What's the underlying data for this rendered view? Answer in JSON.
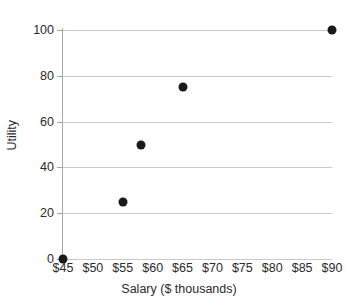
{
  "chart_data": {
    "type": "scatter",
    "title": "",
    "xlabel": "Salary ($ thousands)",
    "ylabel": "Utility",
    "xlim": [
      45,
      90
    ],
    "ylim": [
      0,
      100
    ],
    "grid": true,
    "legend": "none",
    "x_tick_labels": [
      "$45",
      "$50",
      "$55",
      "$60",
      "$65",
      "$70",
      "$75",
      "$80",
      "$85",
      "$90"
    ],
    "x_tick_values": [
      45,
      50,
      55,
      60,
      65,
      70,
      75,
      80,
      85,
      90
    ],
    "y_tick_labels": [
      "0",
      "20",
      "40",
      "60",
      "80",
      "100"
    ],
    "y_tick_values": [
      0,
      20,
      40,
      60,
      80,
      100
    ],
    "series": [
      {
        "name": "Utility vs Salary",
        "marker": "filled-circle",
        "color": "#1a1a1a",
        "points": [
          {
            "x": 45,
            "y": 0
          },
          {
            "x": 55,
            "y": 25
          },
          {
            "x": 58,
            "y": 50
          },
          {
            "x": 65,
            "y": 75
          },
          {
            "x": 90,
            "y": 100
          }
        ]
      }
    ]
  },
  "colors": {
    "gridline": "#c9c9c9",
    "axis": "#a8a8a8",
    "marker": "#1a1a1a",
    "text": "#2b2b2b",
    "background": "#ffffff"
  }
}
